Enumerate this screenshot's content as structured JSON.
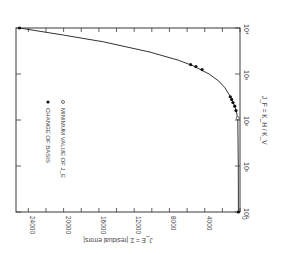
{
  "chart_data": {
    "type": "line",
    "orientation": "rotated 90 degrees clockwise on page",
    "title": "",
    "xlabel": "J_F = K_H / K_V",
    "ylabel": "J_E = Σ |residual errors|",
    "x_scale": "log",
    "xlim": [
      1,
      10000
    ],
    "x_ticks": [
      {
        "value": 1,
        "label": "10⁰"
      },
      {
        "value": 10,
        "label": "10¹"
      },
      {
        "value": 100,
        "label": "10²"
      },
      {
        "value": 1000,
        "label": "10³"
      },
      {
        "value": 10000,
        "label": "10⁴"
      }
    ],
    "ylim": [
      0,
      26000
    ],
    "y_ticks": [
      {
        "value": 0,
        "label": "0"
      },
      {
        "value": 4000,
        "label": "4000"
      },
      {
        "value": 8000,
        "label": "8000"
      },
      {
        "value": 12000,
        "label": "12000"
      },
      {
        "value": 16000,
        "label": "16000"
      },
      {
        "value": 20000,
        "label": "20000"
      },
      {
        "value": 24000,
        "label": "24000"
      }
    ],
    "y_minor_step": 2000,
    "grid": false,
    "legend": {
      "position": "inside, upper-left of rotated plot",
      "entries": [
        {
          "marker": "filled-circle",
          "label": "CHANGE OF BASIS"
        },
        {
          "marker": "open-circle",
          "label": "MINIMUM VALUE OF J_E"
        }
      ]
    },
    "series": [
      {
        "name": "J_E curve",
        "style": "line",
        "x": [
          1,
          10,
          100,
          150,
          200,
          300,
          500,
          700,
          1000,
          1500,
          2000,
          3000,
          5000,
          7000,
          10000
        ],
        "y": [
          180,
          190,
          250,
          400,
          600,
          1000,
          1700,
          2400,
          3500,
          5300,
          7000,
          10200,
          15500,
          20000,
          25000
        ]
      },
      {
        "name": "CHANGE OF BASIS",
        "style": "filled-circle",
        "x": [
          1,
          160,
          200,
          240,
          280,
          320,
          1250,
          1450,
          1600,
          10000
        ],
        "y": [
          180,
          450,
          600,
          800,
          950,
          1100,
          4300,
          5000,
          5600,
          25000
        ]
      },
      {
        "name": "MINIMUM VALUE OF J_E",
        "style": "open-circle",
        "x": [
          110
        ],
        "y": [
          250
        ]
      }
    ]
  }
}
